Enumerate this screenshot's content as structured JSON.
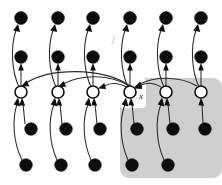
{
  "figure": {
    "width": 222,
    "height": 185,
    "background_color": "#ffffff"
  },
  "labels": {
    "variable_x": "x",
    "index_j": "j"
  },
  "colors": {
    "node_filled": "#0d0d0d",
    "node_open_fill": "#ffffff",
    "node_open_stroke": "#111111",
    "edge": "#2b2b2b",
    "plate_fill": "#cfcfcf",
    "label": "#111111",
    "label_faint": "#c2c2c2"
  },
  "geometry": {
    "columns_x": [
      21,
      58,
      93,
      130,
      166,
      201
    ],
    "row_y": {
      "top_filled": 18,
      "second_filled": 57,
      "open": 92,
      "third_filled": 129,
      "bottom_filled": 165
    },
    "node_radius_filled": 6.2,
    "node_radius_open": 6.0
  },
  "nodes": {
    "filled_top": [
      {
        "id": "t1",
        "col": 1,
        "cx": 21,
        "cy": 18
      },
      {
        "id": "t2",
        "col": 2,
        "cx": 58,
        "cy": 18
      },
      {
        "id": "t3",
        "col": 3,
        "cx": 93,
        "cy": 18
      },
      {
        "id": "t4",
        "col": 4,
        "cx": 130,
        "cy": 18
      },
      {
        "id": "t5",
        "col": 5,
        "cx": 166,
        "cy": 18
      },
      {
        "id": "t6",
        "col": 6,
        "cx": 201,
        "cy": 18
      }
    ],
    "filled_second": [
      {
        "id": "s1",
        "col": 1,
        "cx": 21,
        "cy": 57
      },
      {
        "id": "s2",
        "col": 2,
        "cx": 58,
        "cy": 57
      },
      {
        "id": "s3",
        "col": 3,
        "cx": 93,
        "cy": 57
      },
      {
        "id": "s4",
        "col": 4,
        "cx": 130,
        "cy": 57
      },
      {
        "id": "s5",
        "col": 5,
        "cx": 166,
        "cy": 57
      },
      {
        "id": "s6",
        "col": 6,
        "cx": 201,
        "cy": 57
      }
    ],
    "open": [
      {
        "id": "o1",
        "col": 1,
        "cx": 21,
        "cy": 92
      },
      {
        "id": "o2",
        "col": 2,
        "cx": 58,
        "cy": 92
      },
      {
        "id": "o3",
        "col": 3,
        "cx": 93,
        "cy": 92
      },
      {
        "id": "o4",
        "col": 4,
        "cx": 130,
        "cy": 92,
        "label": "x"
      },
      {
        "id": "o5",
        "col": 5,
        "cx": 166,
        "cy": 92
      },
      {
        "id": "o6",
        "col": 6,
        "cx": 201,
        "cy": 92
      }
    ],
    "filled_third": [
      {
        "id": "u1",
        "col": 1,
        "cx": 31,
        "cy": 129
      },
      {
        "id": "u2",
        "col": 2,
        "cx": 66,
        "cy": 129
      },
      {
        "id": "u3",
        "col": 3,
        "cx": 100,
        "cy": 129
      },
      {
        "id": "u4",
        "col": 4,
        "cx": 137,
        "cy": 129
      },
      {
        "id": "u5",
        "col": 5,
        "cx": 173,
        "cy": 129
      },
      {
        "id": "u6",
        "col": 6,
        "cx": 205,
        "cy": 129
      }
    ],
    "filled_bottom": [
      {
        "id": "b1",
        "col": 1,
        "cx": 26,
        "cy": 165
      },
      {
        "id": "b2",
        "col": 2,
        "cx": 61,
        "cy": 165
      },
      {
        "id": "b3",
        "col": 3,
        "cx": 95,
        "cy": 165
      },
      {
        "id": "b4",
        "col": 4,
        "cx": 132,
        "cy": 165
      },
      {
        "id": "b5",
        "col": 5,
        "cx": 168,
        "cy": 165
      }
    ]
  },
  "plate": {
    "name": "shaded-plate",
    "x": 120,
    "y": 78,
    "width": 102,
    "height": 100,
    "corner_radius": 9,
    "fill": "#cfcfcf"
  },
  "edges": {
    "upward_column_pairs": [
      {
        "from": "s1",
        "to": "t1"
      },
      {
        "from": "s2",
        "to": "t2"
      },
      {
        "from": "s3",
        "to": "t3"
      },
      {
        "from": "s4",
        "to": "t4"
      },
      {
        "from": "s5",
        "to": "t5"
      },
      {
        "from": "s6",
        "to": "t6"
      }
    ],
    "open_to_second": [
      {
        "from": "o1",
        "to": "s1"
      },
      {
        "from": "o2",
        "to": "s2"
      },
      {
        "from": "o3",
        "to": "s3"
      },
      {
        "from": "o4",
        "to": "s4"
      },
      {
        "from": "o5",
        "to": "s5"
      },
      {
        "from": "o6",
        "to": "s6"
      }
    ],
    "long_curved_to_top": [
      {
        "from": "o1",
        "to": "t1"
      },
      {
        "from": "o2",
        "to": "t2"
      },
      {
        "from": "o3",
        "to": "t3"
      },
      {
        "from": "o4",
        "to": "t4"
      },
      {
        "from": "o5",
        "to": "t5"
      },
      {
        "from": "o6",
        "to": "t6"
      }
    ],
    "third_to_open": [
      {
        "from": "u1",
        "to": "o1"
      },
      {
        "from": "u2",
        "to": "o2"
      },
      {
        "from": "u3",
        "to": "o3"
      },
      {
        "from": "u4",
        "to": "o4"
      },
      {
        "from": "u5",
        "to": "o5"
      },
      {
        "from": "u6",
        "to": "o6"
      }
    ],
    "bottom_to_open": [
      {
        "from": "b1",
        "to": "o1"
      },
      {
        "from": "b2",
        "to": "o2"
      },
      {
        "from": "b3",
        "to": "o3"
      },
      {
        "from": "b4",
        "to": "o4"
      },
      {
        "from": "b5",
        "to": "o5"
      }
    ],
    "lateral_from_x": [
      {
        "from": "o4",
        "to": "o1"
      },
      {
        "from": "o4",
        "to": "o2"
      },
      {
        "from": "o4",
        "to": "o3"
      }
    ],
    "lateral_into_x": [
      {
        "from": "o5",
        "to": "o4"
      },
      {
        "from": "o6",
        "to": "o4"
      }
    ]
  }
}
